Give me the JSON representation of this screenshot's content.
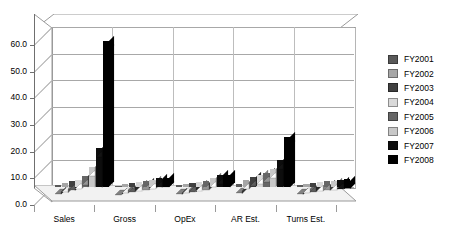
{
  "chart_data": {
    "type": "bar",
    "title": "",
    "subtitle": "",
    "xlabel": "",
    "ylabel": "",
    "ylim": [
      0,
      60
    ],
    "ytick_step": 10,
    "ytick_labels": [
      "0.0",
      "10.0",
      "20.0",
      "30.0",
      "40.0",
      "50.0",
      "60.0"
    ],
    "grid": true,
    "three_d": true,
    "legend_position": "right",
    "categories": [
      "Sales",
      "Gross",
      "OpEx",
      "AR Est.",
      "Turns Est."
    ],
    "series": [
      {
        "name": "FY2001",
        "color": "#595959",
        "values": [
          0.8,
          0.5,
          0.6,
          1.0,
          0.6
        ]
      },
      {
        "name": "FY2002",
        "color": "#a6a6a6",
        "values": [
          1.4,
          1.2,
          1.1,
          2.6,
          1.3
        ]
      },
      {
        "name": "FY2003",
        "color": "#404040",
        "values": [
          2.1,
          1.6,
          1.5,
          3.6,
          1.6
        ]
      },
      {
        "name": "FY2004",
        "color": "#d9d9d9",
        "values": [
          2.8,
          2.0,
          2.0,
          4.4,
          1.9
        ]
      },
      {
        "name": "FY2005",
        "color": "#666666",
        "values": [
          4.2,
          2.4,
          2.4,
          5.2,
          2.1
        ]
      },
      {
        "name": "FY2006",
        "color": "#c8c8c8",
        "values": [
          7.6,
          2.8,
          3.4,
          6.6,
          2.4
        ]
      },
      {
        "name": "FY2007",
        "color": "#0d0d0d",
        "values": [
          14.8,
          3.2,
          4.4,
          10.2,
          2.7
        ]
      },
      {
        "name": "FY2008",
        "color": "#000000",
        "values": [
          54.6,
          3.4,
          4.6,
          18.8,
          2.9
        ]
      }
    ]
  },
  "legend": {
    "entries": [
      {
        "label": "FY2001"
      },
      {
        "label": "FY2002"
      },
      {
        "label": "FY2003"
      },
      {
        "label": "FY2004"
      },
      {
        "label": "FY2005"
      },
      {
        "label": "FY2006"
      },
      {
        "label": "FY2007"
      },
      {
        "label": "FY2008"
      }
    ]
  }
}
